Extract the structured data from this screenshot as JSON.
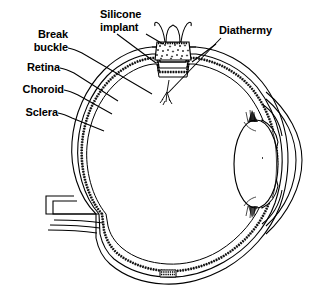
{
  "figure": {
    "background_color": "#ffffff",
    "ink_color": "#000000"
  },
  "labels": {
    "break_buckle": "Break\nbuckle",
    "retina": "Retina",
    "choroid": "Choroid",
    "sclera": "Sclera",
    "silicone_implant": "Silicone\nimplant",
    "diathermy": "Diathermy"
  },
  "anatomy": {
    "globe": "eye-globe",
    "lens": "lens",
    "cornea": "cornea",
    "iris": "iris",
    "ciliary_body": "ciliary-body",
    "optic_nerve": "optic-nerve",
    "vitreous": "vitreous-cavity",
    "buckle_superior": "superior-scleral-buckle",
    "buckle_inferior": "inferior-scleral-buckle",
    "diathermy_marks": "diathermy-burn-marks",
    "sponge_implant": "silicone-sponge-implant"
  }
}
